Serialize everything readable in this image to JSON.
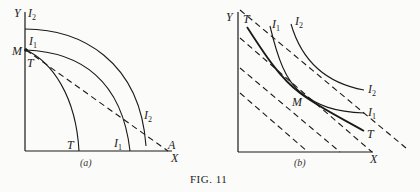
{
  "figure": {
    "caption": "Fig. 11",
    "caption_display": "FIG. 11"
  },
  "panel_a": {
    "caption": "(a)",
    "axes": {
      "y_label": "Y",
      "x_label": "X"
    },
    "labels": {
      "I2_top": "I",
      "I2_top_sub": "2",
      "I1_top": "I",
      "I1_top_sub": "1",
      "M": "M",
      "T_top": "T",
      "T_bottom": "T",
      "I1_bottom": "I",
      "I1_bottom_sub": "1",
      "I2_right": "I",
      "I2_right_sub": "2",
      "A": "A"
    },
    "curves": [
      "T (transformation curve)",
      "I1 (indifference curve)",
      "I2 (indifference curve)",
      "MA (dashed price line)"
    ]
  },
  "panel_b": {
    "caption": "(b)",
    "axes": {
      "y_label": "Y",
      "x_label": "X"
    },
    "labels": {
      "T_top": "T",
      "I1_top": "I",
      "I1_top_sub": "1",
      "I2_top": "I",
      "I2_top_sub": "2",
      "I2_right": "I",
      "I2_right_sub": "2",
      "I1_right": "I",
      "I1_right_sub": "1",
      "T_right": "T",
      "M": "M"
    },
    "curves": [
      "T (transformation curve)",
      "I1 (indifference curve)",
      "I2 (indifference curve)",
      "parallel dashed price lines"
    ]
  },
  "colors": {
    "ink": "#1a1a1a",
    "paper": "#fbfbf9"
  }
}
